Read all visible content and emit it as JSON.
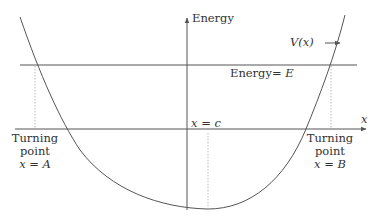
{
  "diagram": {
    "y_axis_label": "Energy",
    "x_axis_label": "x",
    "energy_line_label_prefix": "Energy= ",
    "energy_line_label_symbol": "E",
    "potential_label": "V(x)",
    "center_label": "x = c",
    "turning_point_left": {
      "line1": "Turning",
      "line2": "point",
      "line3": "x = A"
    },
    "turning_point_right": {
      "line1": "Turning",
      "line2": "point",
      "line3": "x = B"
    },
    "colors": {
      "line": "#555555",
      "dotted": "#bbbbbb",
      "text": "#333333"
    }
  }
}
